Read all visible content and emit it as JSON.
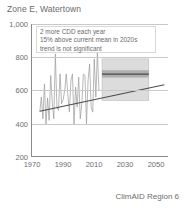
{
  "chart_data": {
    "type": "line",
    "title": "Zone E, Watertown",
    "xlabel": "",
    "ylabel": "",
    "footer": "ClimAID Region 6",
    "grid": true,
    "legend": "none",
    "xlim": [
      1965,
      2053
    ],
    "ylim": [
      200,
      1000
    ],
    "yticks": [
      200,
      400,
      600,
      800,
      1000
    ],
    "ytick_labels": [
      "200",
      "400",
      "600",
      "800",
      "1,000"
    ],
    "xticks": [
      1970,
      1990,
      2010,
      2030,
      2050
    ],
    "xtick_labels": [
      "1970",
      "1990",
      "2010",
      "2030",
      "2050"
    ],
    "annotations": [
      "2 more CDD each year",
      "15% above current mean in 2020s",
      "trend is not significant"
    ],
    "series": [
      {
        "name": "observed-cdd",
        "type": "line",
        "color": "#9a9a9a",
        "x": [
          1970,
          1971,
          1972,
          1973,
          1974,
          1975,
          1976,
          1977,
          1978,
          1979,
          1980,
          1981,
          1982,
          1983,
          1984,
          1985,
          1986,
          1987,
          1988,
          1989,
          1990,
          1991,
          1992,
          1993,
          1994,
          1995,
          1996,
          1997,
          1998,
          1999,
          2000,
          2001,
          2002,
          2003,
          2004,
          2005,
          2006,
          2007,
          2008
        ],
        "values": [
          470,
          560,
          430,
          640,
          395,
          555,
          420,
          690,
          530,
          430,
          820,
          500,
          480,
          700,
          520,
          545,
          600,
          700,
          580,
          470,
          660,
          700,
          395,
          620,
          500,
          680,
          430,
          520,
          700,
          690,
          400,
          660,
          760,
          500,
          470,
          790,
          560,
          830,
          600
        ]
      }
    ],
    "trend_line": {
      "name": "linear-trend",
      "color": "#4a4a4a",
      "x": [
        1970,
        2050
      ],
      "values": [
        475,
        635
      ],
      "slope_per_year": 2,
      "significant": false
    },
    "projection_box": {
      "name": "projection-range-2010-2040",
      "x_start": 2010,
      "x_end": 2040,
      "outer_low": 540,
      "outer_high": 790,
      "inner_low": 678,
      "inner_high": 722,
      "central": 698,
      "outer_color": "#d6d6d6",
      "inner_color": "#a8a8a8",
      "central_color": "#4a4a4a"
    }
  }
}
